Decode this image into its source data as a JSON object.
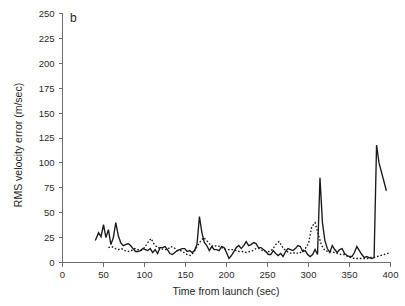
{
  "panel": {
    "label": "b"
  },
  "chart_data": {
    "type": "line",
    "title": "",
    "xlabel": "Time from launch (sec)",
    "ylabel": "RMS velocity error (m/sec)",
    "xlim": [
      0,
      400
    ],
    "ylim": [
      0,
      250
    ],
    "xticks": [
      0,
      50,
      100,
      150,
      200,
      250,
      300,
      350,
      400
    ],
    "xtick_labels": [
      "0",
      "50",
      "100",
      "150",
      "200",
      "250",
      "300",
      "350",
      "400"
    ],
    "yticks": [
      0,
      25,
      50,
      75,
      100,
      125,
      150,
      175,
      200,
      225,
      250
    ],
    "ytick_labels": [
      "0",
      "25",
      "50",
      "75",
      "100",
      "125",
      "150",
      "175",
      "200",
      "225",
      "250"
    ],
    "grid": false,
    "legend": "none",
    "series": [
      {
        "name": "solid",
        "style": "solid",
        "color": "#1a1a1a",
        "x": [
          40,
          44,
          47,
          50,
          53,
          56,
          59,
          62,
          65,
          68,
          71,
          74,
          77,
          80,
          83,
          86,
          89,
          92,
          95,
          98,
          101,
          104,
          107,
          110,
          113,
          116,
          119,
          122,
          125,
          128,
          131,
          134,
          137,
          140,
          143,
          146,
          149,
          152,
          155,
          158,
          161,
          164,
          167,
          170,
          173,
          176,
          179,
          182,
          185,
          188,
          191,
          194,
          197,
          200,
          203,
          206,
          209,
          212,
          215,
          218,
          221,
          224,
          227,
          230,
          233,
          236,
          239,
          242,
          245,
          248,
          251,
          254,
          257,
          260,
          263,
          266,
          269,
          272,
          275,
          278,
          281,
          284,
          287,
          290,
          293,
          296,
          299,
          302,
          305,
          308,
          311,
          314,
          317,
          320,
          323,
          326,
          329,
          332,
          335,
          338,
          341,
          344,
          347,
          350,
          353,
          356,
          359,
          362,
          365,
          368,
          371,
          374,
          377,
          380,
          383,
          386,
          395
        ],
        "y": [
          22,
          30,
          26,
          38,
          25,
          33,
          18,
          25,
          40,
          27,
          20,
          17,
          18,
          19,
          17,
          14,
          11,
          11,
          12,
          14,
          13,
          12,
          14,
          10,
          13,
          9,
          15,
          15,
          16,
          13,
          9,
          8,
          10,
          12,
          13,
          14,
          14,
          11,
          12,
          10,
          12,
          18,
          46,
          30,
          20,
          17,
          12,
          16,
          13,
          13,
          12,
          16,
          15,
          10,
          4,
          7,
          11,
          15,
          17,
          14,
          17,
          21,
          17,
          18,
          20,
          19,
          15,
          15,
          13,
          11,
          8,
          8,
          12,
          9,
          7,
          9,
          6,
          11,
          14,
          13,
          12,
          14,
          17,
          16,
          11,
          12,
          8,
          6,
          8,
          13,
          8,
          85,
          40,
          22,
          14,
          10,
          17,
          13,
          10,
          13,
          14,
          9,
          7,
          6,
          6,
          10,
          16,
          12,
          8,
          5,
          6,
          5,
          4,
          5,
          118,
          100,
          72
        ]
      },
      {
        "name": "dotted",
        "style": "dotted",
        "color": "#1a1a1a",
        "x": [
          56,
          60,
          64,
          68,
          72,
          76,
          80,
          84,
          88,
          92,
          96,
          100,
          104,
          108,
          112,
          116,
          120,
          124,
          128,
          132,
          136,
          140,
          144,
          148,
          152,
          156,
          160,
          164,
          168,
          172,
          176,
          180,
          184,
          188,
          192,
          196,
          200,
          204,
          208,
          212,
          216,
          220,
          224,
          228,
          232,
          236,
          240,
          244,
          248,
          252,
          256,
          260,
          264,
          268,
          272,
          276,
          280,
          284,
          288,
          292,
          296,
          300,
          304,
          308,
          312,
          316,
          320,
          324,
          328,
          332,
          336,
          340,
          344,
          348,
          352,
          356,
          360,
          364,
          368,
          372,
          376,
          380,
          384,
          388,
          392,
          396,
          400
        ],
        "y": [
          15,
          16,
          14,
          13,
          14,
          12,
          11,
          12,
          14,
          13,
          12,
          15,
          20,
          24,
          18,
          15,
          14,
          13,
          13,
          16,
          15,
          12,
          12,
          10,
          8,
          7,
          10,
          16,
          21,
          25,
          22,
          18,
          16,
          17,
          16,
          14,
          13,
          13,
          13,
          12,
          11,
          11,
          10,
          11,
          12,
          14,
          14,
          12,
          11,
          11,
          13,
          18,
          21,
          16,
          12,
          10,
          9,
          10,
          9,
          11,
          14,
          19,
          36,
          40,
          28,
          17,
          12,
          11,
          11,
          10,
          9,
          8,
          8,
          6,
          5,
          4,
          4,
          4,
          4,
          4,
          5,
          5,
          6,
          7,
          8,
          9,
          10
        ]
      }
    ]
  }
}
